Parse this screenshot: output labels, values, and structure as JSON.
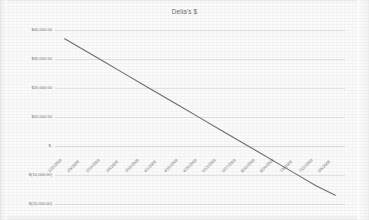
{
  "chart_data": {
    "type": "line",
    "title": "Delia's $",
    "xlabel": "",
    "ylabel": "",
    "grid": true,
    "legend": "none",
    "ylim": [
      -20000,
      40000
    ],
    "ytick_labels": [
      "$40,000.00",
      "$30,000.00",
      "$20,000.00",
      "$10,000.00",
      "$-",
      "$(10,000.00)",
      "$(20,000.00)"
    ],
    "ytick_values": [
      40000,
      30000,
      20000,
      10000,
      0,
      -10000,
      -20000
    ],
    "categories": [
      "1/22/2008",
      "2/5/2008",
      "2/19/2008",
      "3/4/2008",
      "3/18/2008",
      "4/1/2008",
      "4/15/2008",
      "4/29/2008",
      "5/13/2008",
      "5/27/2008",
      "6/10/2008",
      "6/24/2008",
      "7/8/2008",
      "7/22/2008",
      "8/5/2008"
    ],
    "series": [
      {
        "name": "Delia's $",
        "values": [
          37000,
          33100,
          29200,
          25300,
          21400,
          17500,
          13600,
          9700,
          5800,
          1900,
          -2000,
          -5900,
          -9800,
          -13700,
          -17000
        ]
      }
    ]
  }
}
